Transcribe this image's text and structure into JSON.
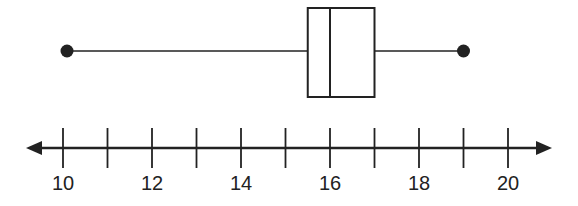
{
  "chart_data": {
    "type": "boxplot",
    "title": "",
    "xlabel": "",
    "ylabel": "",
    "axis": {
      "min": 10,
      "max": 20,
      "tick_step": 1,
      "labeled_ticks": [
        10,
        12,
        14,
        16,
        18,
        20
      ],
      "arrows_both_ends": true
    },
    "box": {
      "min": 10,
      "q1": 15.5,
      "median": 16,
      "q3": 17,
      "max": 19
    },
    "grid": false,
    "legend": null
  },
  "colors": {
    "line": "#222222",
    "background": "#ffffff"
  }
}
